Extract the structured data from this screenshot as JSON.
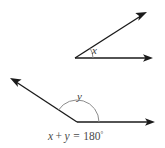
{
  "figure": {
    "background_color": "#ffffff",
    "line_color": "#1a1a1a",
    "arc_color": "#8c8c8c",
    "label_color": "#3a3a3a",
    "equation_color": "#4a4a4a",
    "top_angle": {
      "name": "acute-angle-x",
      "label": "x",
      "vertex": "75,58",
      "horizontal_ray_tip": "153,58",
      "slanted_ray_tip": "147,12",
      "measure_degrees": 33,
      "arc_radius": 18
    },
    "bottom_angle": {
      "name": "obtuse-angle-y",
      "label": "y",
      "vertex": "77,122",
      "horizontal_ray_tip": "155,122",
      "slanted_ray_tip": "10,78",
      "measure_degrees": 147,
      "arc_radius": 22
    },
    "equation": {
      "full": "x + y = 180°",
      "left_var": "x",
      "plus": "+",
      "right_var": "y",
      "equals": "=",
      "value": "180",
      "degree_symbol": "°"
    }
  }
}
